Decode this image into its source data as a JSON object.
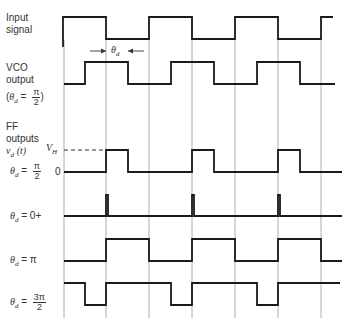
{
  "labels": {
    "input": [
      "Input",
      "signal"
    ],
    "vco": [
      "VCO",
      "output"
    ],
    "vco_cond": {
      "lhs": "θ",
      "sub": "d",
      "eq": "=",
      "num": "π",
      "den": "2"
    },
    "ff": [
      "FF",
      "outputs"
    ],
    "ff_vd": {
      "v": "v",
      "sub": "d",
      "arg": "(t)"
    },
    "vh": {
      "v": "V",
      "sub": "H"
    },
    "zero": "0",
    "theta_d_marker": {
      "t": "θ",
      "sub": "d"
    },
    "rows": [
      {
        "lhs": "θ",
        "sub": "d",
        "eq": "=",
        "num": "π",
        "den": "2",
        "plain": ""
      },
      {
        "lhs": "θ",
        "sub": "d",
        "eq": "=",
        "num": "",
        "den": "",
        "plain": "0+"
      },
      {
        "lhs": "θ",
        "sub": "d",
        "eq": "=",
        "num": "",
        "den": "",
        "plain": "π"
      },
      {
        "lhs": "θ",
        "sub": "d",
        "eq": "=",
        "num": "3π",
        "den": "2",
        "plain": ""
      }
    ]
  },
  "colors": {
    "trace": "#1a1a1a",
    "grid": "#9a9a9a"
  },
  "gridlines_x": [
    64,
    106,
    149,
    192,
    235,
    278,
    321
  ],
  "waveforms": [
    {
      "name": "input-signal",
      "hi": 17,
      "lo": 39,
      "points": [
        [
          63,
          "L-start"
        ],
        [
          63,
          "H"
        ],
        [
          106,
          "L"
        ],
        [
          149,
          "H"
        ],
        [
          192,
          "L"
        ],
        [
          235,
          "H"
        ],
        [
          278,
          "L"
        ],
        [
          321,
          "H"
        ],
        [
          333,
          "H"
        ]
      ]
    },
    {
      "name": "vco-output",
      "hi": 62,
      "lo": 84,
      "points": [
        [
          64,
          "L"
        ],
        [
          85,
          "H"
        ],
        [
          128,
          "L"
        ],
        [
          171,
          "H"
        ],
        [
          214,
          "L"
        ],
        [
          257,
          "H"
        ],
        [
          300,
          "L"
        ],
        [
          335,
          "L"
        ]
      ]
    },
    {
      "name": "ff-pi-over-2",
      "hi": 150,
      "lo": 172,
      "points": [
        [
          64,
          "L"
        ],
        [
          106,
          "H"
        ],
        [
          128,
          "L"
        ],
        [
          192,
          "H"
        ],
        [
          214,
          "L"
        ],
        [
          278,
          "H"
        ],
        [
          300,
          "L"
        ],
        [
          342,
          "L"
        ]
      ]
    },
    {
      "name": "ff-0-plus",
      "hi": 195,
      "lo": 216,
      "points": [
        [
          64,
          "L"
        ],
        [
          106,
          "H"
        ],
        [
          108,
          "L"
        ],
        [
          192,
          "H"
        ],
        [
          194,
          "L"
        ],
        [
          278,
          "H"
        ],
        [
          280,
          "L"
        ],
        [
          342,
          "L"
        ]
      ]
    },
    {
      "name": "ff-pi",
      "hi": 239,
      "lo": 261,
      "points": [
        [
          64,
          "L"
        ],
        [
          106,
          "H"
        ],
        [
          149,
          "L"
        ],
        [
          192,
          "H"
        ],
        [
          235,
          "L"
        ],
        [
          278,
          "H"
        ],
        [
          321,
          "L"
        ],
        [
          342,
          "L"
        ]
      ]
    },
    {
      "name": "ff-3pi-over-2",
      "hi": 283,
      "lo": 305,
      "points": [
        [
          64,
          "H"
        ],
        [
          85,
          "L"
        ],
        [
          106,
          "H"
        ],
        [
          171,
          "L"
        ],
        [
          192,
          "H"
        ],
        [
          257,
          "L"
        ],
        [
          278,
          "H"
        ],
        [
          340,
          "H"
        ]
      ]
    }
  ],
  "vh_dash": {
    "x1": 64,
    "x2": 106,
    "y": 150
  },
  "theta_arrow": {
    "y": 51,
    "x_left": 106,
    "x_right": 128
  }
}
